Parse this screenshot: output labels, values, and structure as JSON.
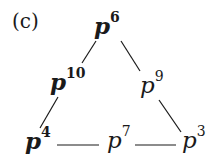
{
  "panel_label": "(c)",
  "nodes": [
    {
      "id": "p6",
      "base": "p",
      "exp": "6",
      "bold": true,
      "x": 94,
      "y": 12
    },
    {
      "id": "p10",
      "base": "p",
      "exp": "10",
      "bold": true,
      "x": 50,
      "y": 68
    },
    {
      "id": "p9",
      "base": "p",
      "exp": "9",
      "bold": false,
      "x": 140,
      "y": 72
    },
    {
      "id": "p4",
      "base": "p",
      "exp": "4",
      "bold": true,
      "x": 25,
      "y": 127
    },
    {
      "id": "p7",
      "base": "p",
      "exp": "7",
      "bold": false,
      "x": 107,
      "y": 127
    },
    {
      "id": "p3",
      "base": "p",
      "exp": "3",
      "bold": false,
      "x": 182,
      "y": 127
    }
  ],
  "edges": [
    {
      "from": "p6",
      "to": "p10",
      "x1": 96,
      "y1": 41,
      "x2": 82,
      "y2": 63
    },
    {
      "from": "p6",
      "to": "p9",
      "x1": 121,
      "y1": 41,
      "x2": 140,
      "y2": 71
    },
    {
      "from": "p10",
      "to": "p4",
      "x1": 58,
      "y1": 97,
      "x2": 40,
      "y2": 128
    },
    {
      "from": "p9",
      "to": "p3",
      "x1": 159,
      "y1": 100,
      "x2": 181,
      "y2": 132
    },
    {
      "from": "p4",
      "to": "p7",
      "x1": 57,
      "y1": 145,
      "x2": 99,
      "y2": 145
    },
    {
      "from": "p7",
      "to": "p3",
      "x1": 135,
      "y1": 145,
      "x2": 176,
      "y2": 145
    }
  ],
  "colors": {
    "ink": "#1a1a1a",
    "background": "#ffffff"
  }
}
